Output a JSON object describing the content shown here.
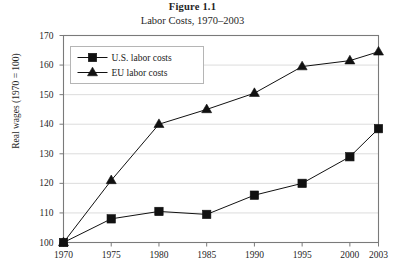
{
  "figure": {
    "title": "Figure 1.1",
    "subtitle": "Labor Costs, 1970–2003"
  },
  "axes": {
    "ylabel": "Real wages (1970 = 100)",
    "xlabel": ""
  },
  "colors": {
    "series_us": "#111111",
    "series_eu": "#111111",
    "frame": "#7a7a7a",
    "grid": "#dcdcdc",
    "text": "#1a1a1a",
    "background": "#ffffff"
  },
  "chart_data": {
    "type": "line",
    "title": "Figure 1.1",
    "subtitle": "Labor Costs, 1970–2003",
    "xlabel": "",
    "ylabel": "Real wages (1970 = 100)",
    "categories": [
      "1970",
      "1975",
      "1980",
      "1985",
      "1990",
      "1995",
      "2000",
      "2003"
    ],
    "x": [
      1970,
      1975,
      1980,
      1985,
      1990,
      1995,
      2000,
      2003
    ],
    "xlim": [
      1970,
      2003
    ],
    "ylim": [
      100,
      170
    ],
    "yticks": [
      100,
      110,
      120,
      130,
      140,
      150,
      160,
      170
    ],
    "xticks": [
      1970,
      1975,
      1980,
      1985,
      1990,
      1995,
      2000,
      2003
    ],
    "grid": true,
    "legend_position": "upper-left",
    "series": [
      {
        "name": "U.S. labor costs",
        "marker": "square",
        "values": [
          100,
          108,
          110.5,
          109.5,
          116,
          120,
          129,
          138.5
        ]
      },
      {
        "name": "EU labor costs",
        "marker": "triangle",
        "values": [
          100,
          121,
          140,
          145,
          150.5,
          159.5,
          161.5,
          164.5
        ]
      }
    ]
  }
}
